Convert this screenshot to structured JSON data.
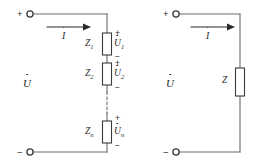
{
  "diagram": {
    "background_color": "#ffffff",
    "line_color": "#6b6b6b",
    "text_color": "#2b2b2b"
  },
  "symbols": {
    "plus": "+",
    "minus": "−",
    "dash": "–"
  },
  "left_circuit": {
    "name": "series-impedance-circuit",
    "source_label": "U",
    "current_label": "I",
    "terminal_positive": "+",
    "terminal_negative": "−",
    "elements": [
      {
        "impedance_label": "Z",
        "impedance_subscript": "1",
        "voltage_label": "U",
        "voltage_subscript": "1",
        "polarity_top": "+",
        "polarity_bottom": "−"
      },
      {
        "impedance_label": "Z",
        "impedance_subscript": "2",
        "voltage_label": "U",
        "voltage_subscript": "2",
        "polarity_top": "+",
        "polarity_bottom": "−"
      },
      {
        "impedance_label": "Z",
        "impedance_subscript": "n",
        "voltage_label": "U",
        "voltage_subscript": "n",
        "polarity_top": "+",
        "polarity_bottom": "−"
      }
    ],
    "continuation": "dashed-line"
  },
  "right_circuit": {
    "name": "equivalent-impedance-circuit",
    "source_label": "U",
    "current_label": "I",
    "terminal_positive": "+",
    "terminal_negative": "−",
    "impedance_label": "Z"
  }
}
